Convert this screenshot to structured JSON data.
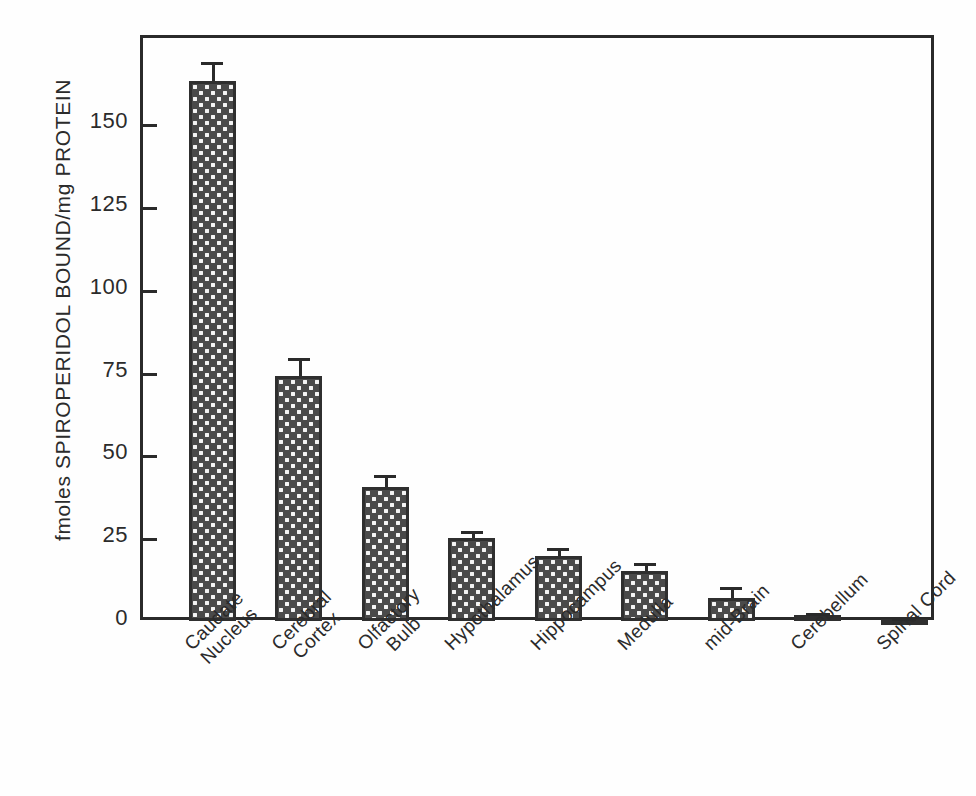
{
  "chart_data": {
    "type": "bar",
    "title": "",
    "xlabel": "",
    "ylabel": "fmoles SPIROPERIDOL BOUND/mg PROTEIN",
    "ylim": [
      0,
      175
    ],
    "yticks": [
      0,
      25,
      50,
      75,
      100,
      125,
      150
    ],
    "ytick_labels": [
      "0",
      "25",
      "50",
      "75",
      "100",
      "125",
      "150"
    ],
    "grid": false,
    "legend": null,
    "categories": [
      "Caudate Nucleus",
      "Cerebral Cortex",
      "Olfactory Bulb",
      "Hypothalamus",
      "Hippocampus",
      "Medulla",
      "mid-Brain",
      "Cerebellum",
      "Spinal Cord"
    ],
    "category_lines": [
      [
        "Caudate",
        "Nucleus"
      ],
      [
        "Cerebral",
        "Cortex"
      ],
      [
        "Olfactory",
        "Bulb"
      ],
      [
        "Hypothalamus"
      ],
      [
        "Hippocampus"
      ],
      [
        "Medulla"
      ],
      [
        "mid-Brain"
      ],
      [
        "Cerebellum"
      ],
      [
        "Spinal Cord"
      ]
    ],
    "values": [
      163,
      74,
      40.5,
      25,
      19.5,
      15,
      7,
      1.8,
      0.6
    ],
    "errors": [
      5.7,
      5.5,
      3.5,
      2.3,
      2.5,
      2.5,
      3.2,
      0.6,
      0.3
    ],
    "bar_fill": "#4a4a4a",
    "bar_pattern": "white-dot-crosshatch",
    "bar_edge_color": "#2f2f2f",
    "axis_color": "#2a2a2a",
    "background": "#fefefe"
  }
}
